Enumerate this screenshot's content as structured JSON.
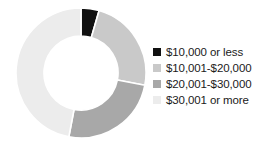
{
  "chart_data": {
    "type": "pie",
    "variant": "donut",
    "title": "",
    "subtitle": "",
    "xlabel": "",
    "ylabel": "",
    "grid": false,
    "legend_position": "right",
    "hole_ratio": 0.57,
    "start_angle_deg": 0,
    "direction": "clockwise",
    "categories": [
      "$10,000 or less",
      "$10,001-$20,000",
      "$20,001-$30,000",
      "$30,001 or more"
    ],
    "values": [
      4.5,
      23.5,
      25.0,
      47.0
    ],
    "units": "percent",
    "colors": [
      "#111111",
      "#c9c9c9",
      "#a8a8a8",
      "#ececec"
    ],
    "slice_separator_color": "#ffffff",
    "slice_separator_width": 1.6
  },
  "legend": {
    "items": [
      {
        "label": "$10,000 or less",
        "color": "#111111"
      },
      {
        "label": "$10,001-$20,000",
        "color": "#c9c9c9"
      },
      {
        "label": "$20,001-$30,000",
        "color": "#a8a8a8"
      },
      {
        "label": "$30,001 or more",
        "color": "#ececec"
      }
    ]
  },
  "canvas": {
    "background": "#ffffff",
    "width": 271,
    "height": 147
  }
}
